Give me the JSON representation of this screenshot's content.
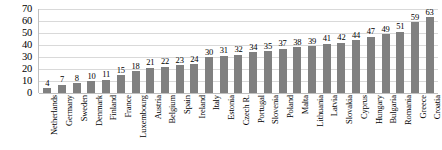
{
  "chart_data": {
    "type": "bar",
    "title": "",
    "subtitle": "",
    "xlabel": "",
    "ylabel": "",
    "ylim": [
      0,
      70
    ],
    "yticks": [
      70,
      60,
      50,
      40,
      30,
      20,
      10,
      0
    ],
    "grid": true,
    "legend": false,
    "legend_position": "none",
    "orientation": "vertical",
    "bar_color": "#808080",
    "gridline_color": "#d9d9d9",
    "axis_color": "#bfbfbf",
    "data_labels": true,
    "categories": [
      "Netherlands",
      "Germany",
      "Sweden",
      "Denmark",
      "Finland",
      "France",
      "Luxembourg",
      "Austria",
      "Belgium",
      "Spain",
      "Ireland",
      "Italy",
      "Estonia",
      "Czech R.",
      "Portugal",
      "Slovenia",
      "Poland",
      "Malta",
      "Lithuania",
      "Latvia",
      "Slovakia",
      "Cyprus",
      "Hungary",
      "Bulgaria",
      "Romania",
      "Greece",
      "Croatia"
    ],
    "values": [
      4,
      7,
      8,
      10,
      11,
      15,
      18,
      21,
      22,
      23,
      24,
      30,
      31,
      32,
      34,
      35,
      37,
      38,
      39,
      41,
      42,
      44,
      47,
      49,
      51,
      59,
      63
    ]
  }
}
